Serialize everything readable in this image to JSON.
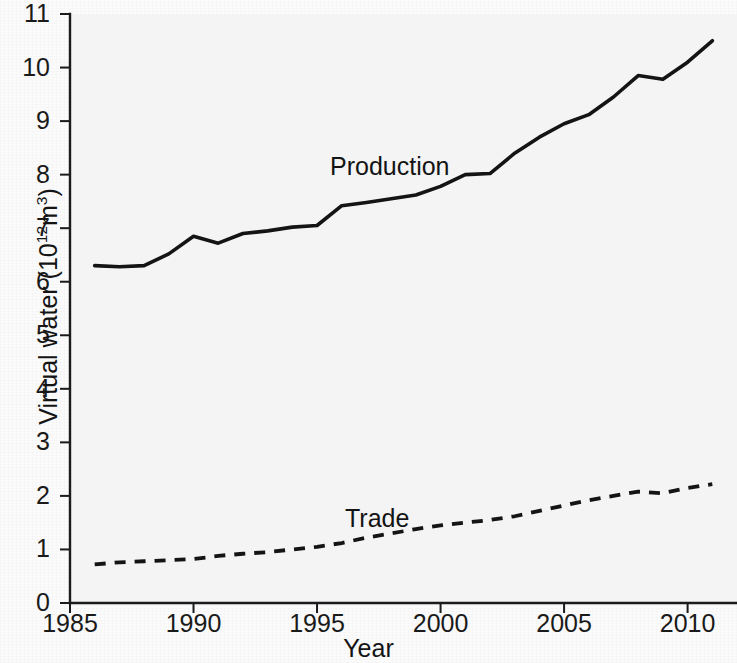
{
  "chart_data": {
    "type": "line",
    "title": "",
    "xlabel": "Year",
    "ylabel": "Virtual water (10¹²m³)",
    "ylabel_text": "Virtual water (10",
    "ylabel_exponent": "12",
    "ylabel_tail": "m",
    "ylabel_tail_exponent": "3",
    "ylabel_close": ")",
    "xlim": [
      1985,
      2012
    ],
    "ylim": [
      0,
      11
    ],
    "grid": false,
    "legend_position": "inline-annotations",
    "x_ticks": [
      "1985",
      "1990",
      "1995",
      "2000",
      "2005",
      "2010"
    ],
    "x_tick_values": [
      1985,
      1990,
      1995,
      2000,
      2005,
      2010
    ],
    "y_ticks": [
      "0",
      "1",
      "2",
      "3",
      "4",
      "5",
      "6",
      "7",
      "8",
      "9",
      "10",
      "11"
    ],
    "y_tick_values": [
      0,
      1,
      2,
      3,
      4,
      5,
      6,
      7,
      8,
      9,
      10,
      11
    ],
    "x": [
      1986,
      1987,
      1988,
      1989,
      1990,
      1991,
      1992,
      1993,
      1994,
      1995,
      1996,
      1997,
      1998,
      1999,
      2000,
      2001,
      2002,
      2003,
      2004,
      2005,
      2006,
      2007,
      2008,
      2009,
      2010,
      2011
    ],
    "series": [
      {
        "name": "Production",
        "style": "solid",
        "color": "#141414",
        "values": [
          6.3,
          6.28,
          6.3,
          6.52,
          6.85,
          6.72,
          6.9,
          6.95,
          7.02,
          7.05,
          7.42,
          7.48,
          7.55,
          7.62,
          7.78,
          8.0,
          8.02,
          8.4,
          8.7,
          8.95,
          9.12,
          9.45,
          9.85,
          9.78,
          10.1,
          10.5
        ]
      },
      {
        "name": "Trade",
        "style": "dashed",
        "color": "#141414",
        "values": [
          0.72,
          0.76,
          0.78,
          0.8,
          0.82,
          0.88,
          0.92,
          0.95,
          1.0,
          1.05,
          1.12,
          1.22,
          1.3,
          1.38,
          1.45,
          1.5,
          1.55,
          1.62,
          1.72,
          1.82,
          1.92,
          2.0,
          2.08,
          2.05,
          2.15,
          2.22
        ]
      }
    ],
    "annotations": [
      {
        "label": "Production",
        "x": 1996.5,
        "y": 8.4
      },
      {
        "label": "Trade",
        "x": 1998.2,
        "y": 1.95
      }
    ]
  }
}
